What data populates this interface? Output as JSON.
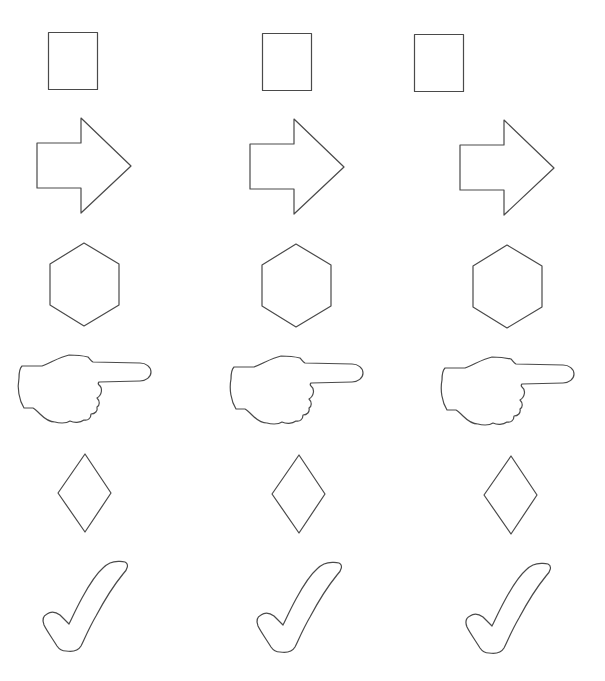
{
  "page": {
    "background": "#ffffff",
    "stroke_color": "#4a4a4a",
    "layout": "6 rows x 3 columns of outline shapes"
  },
  "columns": [
    {
      "index": 1,
      "dx": 0,
      "dy": 0
    },
    {
      "index": 2,
      "dx": 212,
      "dy": 1
    },
    {
      "index": 3,
      "dx": 423,
      "dy": 2
    }
  ],
  "rows": [
    {
      "index": 1,
      "shape": "square",
      "label": "square"
    },
    {
      "index": 2,
      "shape": "arrow-right",
      "label": "right arrow"
    },
    {
      "index": 3,
      "shape": "hexagon",
      "label": "hexagon"
    },
    {
      "index": 4,
      "shape": "pointing-hand",
      "label": "pointing hand"
    },
    {
      "index": 5,
      "shape": "diamond",
      "label": "diamond"
    },
    {
      "index": 6,
      "shape": "checkmark",
      "label": "check mark"
    }
  ]
}
